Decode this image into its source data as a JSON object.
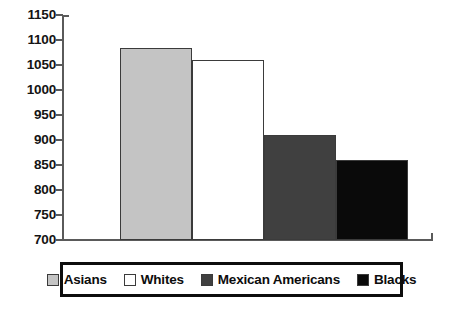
{
  "chart_data": {
    "type": "bar",
    "title": "",
    "xlabel": "",
    "ylabel": "",
    "categories": [
      "Asians",
      "Whites",
      "Mexican Americans",
      "Blacks"
    ],
    "values": [
      1085,
      1060,
      910,
      860
    ],
    "series": [
      {
        "name": "Values",
        "values": [
          1085,
          1060,
          910,
          860
        ]
      }
    ],
    "ylim": [
      700,
      1150
    ],
    "yticks": [
      700,
      750,
      800,
      850,
      900,
      950,
      1000,
      1050,
      1100,
      1150
    ],
    "ytick_labels": [
      "700",
      "750",
      "800",
      "850",
      "900",
      "950",
      "1000",
      "1050",
      "1100",
      "1150"
    ],
    "xtick_labels": [],
    "grid": false,
    "legend_position": "bottom",
    "bar_colors": [
      "#c4c4c4",
      "#ffffff",
      "#404040",
      "#0a0a0a"
    ],
    "bar_edge_color": "#3b3b3b",
    "axis_color": "#5a5a5a",
    "legend": [
      {
        "label": "Asians",
        "color": "#c4c4c4"
      },
      {
        "label": "Whites",
        "color": "#ffffff"
      },
      {
        "label": "Mexican Americans",
        "color": "#404040"
      },
      {
        "label": "Blacks",
        "color": "#0a0a0a"
      }
    ]
  }
}
